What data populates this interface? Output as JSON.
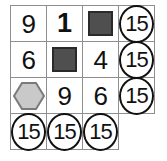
{
  "puzzle": {
    "title": "Shape sum grid puzzle",
    "grid_size": {
      "rows": 4,
      "cols": 4
    },
    "colors": {
      "grid_line": "#8f8f8f",
      "square_fill": "#4f4f4f",
      "square_stroke": "#2a2a2a",
      "hexagon_fill": "#c9c9c9",
      "hexagon_stroke": "#7a7a7a",
      "token_stroke": "#111111",
      "text": "#111111",
      "background": "#ffffff"
    },
    "rows": [
      {
        "cells": [
          {
            "kind": "digit",
            "value": "9",
            "name": "cell-r1c1"
          },
          {
            "kind": "digit",
            "value": "1",
            "name": "cell-r1c2"
          },
          {
            "kind": "square",
            "value": "",
            "name": "cell-r1c3"
          },
          {
            "kind": "sum",
            "value": "15",
            "name": "row-sum-1"
          }
        ]
      },
      {
        "cells": [
          {
            "kind": "digit",
            "value": "6",
            "name": "cell-r2c1"
          },
          {
            "kind": "square",
            "value": "",
            "name": "cell-r2c2"
          },
          {
            "kind": "digit",
            "value": "4",
            "name": "cell-r2c3"
          },
          {
            "kind": "sum",
            "value": "15",
            "name": "row-sum-2"
          }
        ]
      },
      {
        "cells": [
          {
            "kind": "hexagon",
            "value": "",
            "name": "cell-r3c1"
          },
          {
            "kind": "digit",
            "value": "9",
            "name": "cell-r3c2"
          },
          {
            "kind": "digit",
            "value": "6",
            "name": "cell-r3c3"
          },
          {
            "kind": "sum",
            "value": "15",
            "name": "row-sum-3"
          }
        ]
      },
      {
        "cells": [
          {
            "kind": "sum",
            "value": "15",
            "name": "col-sum-1"
          },
          {
            "kind": "sum",
            "value": "15",
            "name": "col-sum-2"
          },
          {
            "kind": "sum",
            "value": "15",
            "name": "col-sum-3"
          },
          {
            "kind": "blank",
            "value": "",
            "name": "corner-blank"
          }
        ]
      }
    ]
  }
}
